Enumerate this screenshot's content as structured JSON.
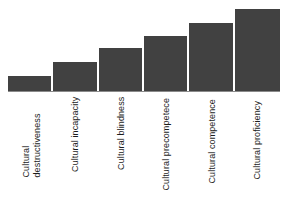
{
  "chart_data": {
    "type": "bar",
    "title": "",
    "subtitle": "",
    "xlabel": "",
    "ylabel": "",
    "grid": false,
    "legend": false,
    "legend_position": "none",
    "orientation": "vertical",
    "bar_color": "#414141",
    "axis_color": "#8a8a8a",
    "background": "#ffffff",
    "ylim": [
      0,
      100
    ],
    "xlabel_rotation": -90,
    "categories": [
      "Cultural destructiveness",
      "Cultural incapacity",
      "Cultural blindness",
      "Cultural precompetece",
      "Cultural competence",
      "Cultural proficiency"
    ],
    "category_lines": [
      [
        "Cultural",
        "destructiveness"
      ],
      [
        "Cultural incapacity"
      ],
      [
        "Cultural blindness"
      ],
      [
        "Cultural precompetece"
      ],
      [
        "Cultural competence"
      ],
      [
        "Cultural proficiency"
      ]
    ],
    "values": [
      17,
      33,
      49,
      63,
      78,
      94
    ],
    "tick_labels": [],
    "annotations": []
  },
  "axes": {
    "x_axis_name": "cultural-competence-continuum",
    "y_axis_name": "level"
  }
}
